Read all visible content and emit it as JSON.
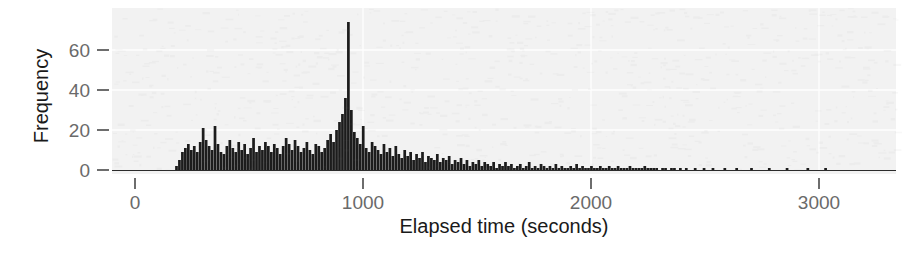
{
  "figure": {
    "title": "",
    "xlabel": "Elapsed time (seconds)",
    "ylabel": "Frequency"
  },
  "colors": {
    "bar": "#1c1c1c",
    "panel": "#f2f2f2",
    "grid": "#ffffff",
    "ticklabel": "#6a6a6a",
    "axistitle": "#1a1a1a"
  },
  "chart_data": {
    "type": "bar",
    "title": "",
    "xlabel": "Elapsed time (seconds)",
    "ylabel": "Frequency",
    "xlim": [
      0,
      3450
    ],
    "ylim": [
      0,
      78
    ],
    "xticks": [
      0,
      1000,
      2000,
      3000
    ],
    "xticklabels": [
      "0",
      "1000",
      "2000",
      "3000"
    ],
    "yticks": [
      0,
      20,
      40,
      60
    ],
    "yticklabels": [
      "0",
      "20",
      "40",
      "60"
    ],
    "grid": "horizontal-white",
    "legend": null,
    "bin_width": 13,
    "bin_start": 176,
    "note": "Histogram of elapsed time in seconds; right-skewed with a long tail and a sharp spike near 500 s.",
    "values": [
      2,
      5,
      9,
      11,
      13,
      10,
      12,
      9,
      14,
      21,
      15,
      12,
      10,
      22,
      13,
      9,
      8,
      12,
      15,
      11,
      9,
      14,
      10,
      13,
      8,
      11,
      16,
      9,
      12,
      10,
      14,
      12,
      9,
      13,
      11,
      8,
      12,
      16,
      13,
      10,
      15,
      12,
      9,
      11,
      14,
      10,
      8,
      13,
      12,
      9,
      11,
      15,
      18,
      14,
      20,
      24,
      28,
      36,
      74,
      30,
      19,
      16,
      13,
      22,
      11,
      9,
      14,
      12,
      10,
      8,
      13,
      9,
      11,
      7,
      12,
      8,
      6,
      10,
      7,
      9,
      5,
      8,
      6,
      9,
      4,
      7,
      6,
      5,
      8,
      4,
      6,
      5,
      7,
      3,
      5,
      4,
      6,
      3,
      5,
      2,
      4,
      3,
      5,
      2,
      4,
      3,
      2,
      4,
      1,
      3,
      2,
      4,
      2,
      3,
      1,
      2,
      3,
      1,
      2,
      4,
      1,
      2,
      1,
      3,
      2,
      1,
      2,
      1,
      3,
      1,
      2,
      1,
      1,
      2,
      1,
      3,
      1,
      2,
      1,
      1,
      2,
      1,
      1,
      2,
      1,
      1,
      2,
      1,
      1,
      2,
      1,
      1,
      1,
      2,
      1,
      1,
      1,
      1,
      2,
      1,
      1,
      1,
      1,
      0,
      1,
      1,
      0,
      1,
      1,
      0,
      1,
      0,
      1,
      0,
      0,
      1,
      0,
      0,
      1,
      0,
      0,
      1,
      0,
      0,
      0,
      1,
      0,
      0,
      0,
      1,
      0,
      0,
      0,
      0,
      1,
      0,
      0,
      0,
      0,
      0,
      1,
      0,
      0,
      0,
      0,
      0,
      1,
      0,
      0,
      0,
      0,
      0,
      0,
      1,
      0,
      0,
      0,
      0,
      0,
      1
    ]
  }
}
